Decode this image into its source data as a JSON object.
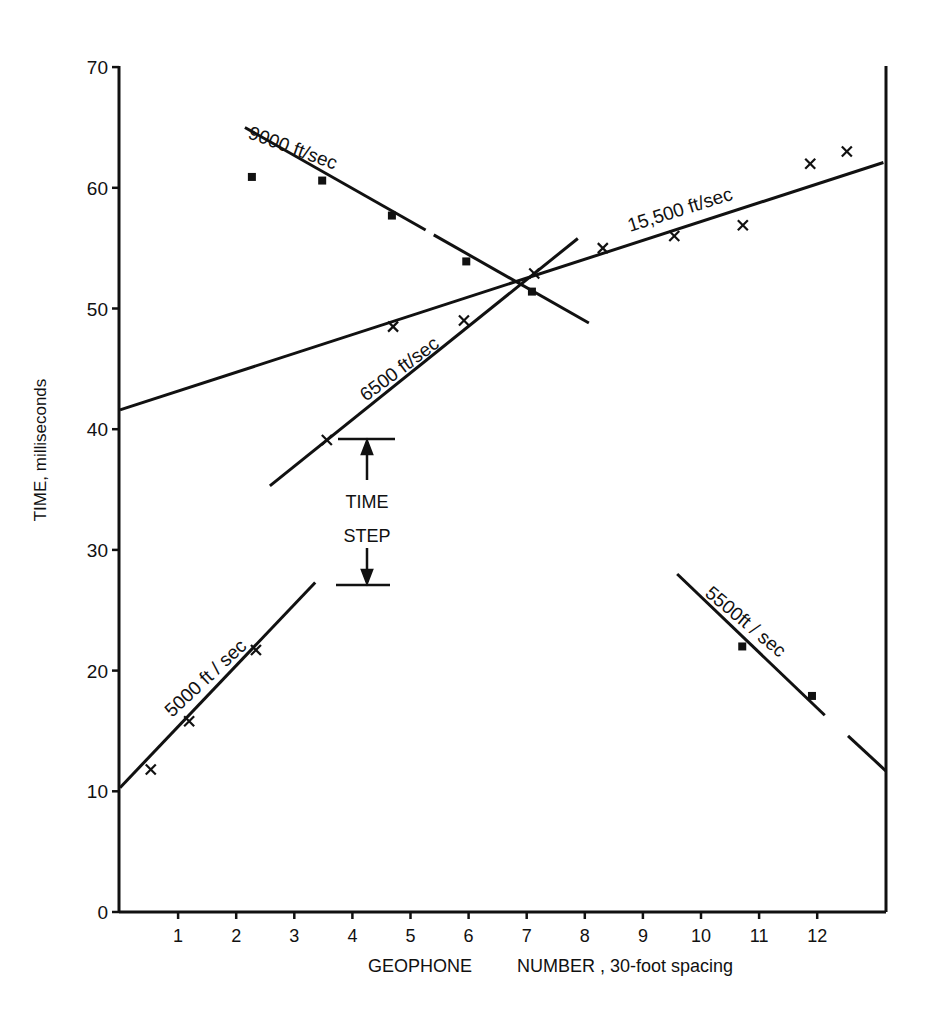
{
  "chart_data": {
    "type": "scatter",
    "title": "",
    "xlabel": "GEOPHONE      NUMBER , 30-foot spacing",
    "ylabel": "TIME, milliseconds",
    "xlim": [
      0,
      13.2
    ],
    "ylim": [
      0,
      70
    ],
    "grid": false,
    "x_ticks": [
      1,
      2,
      3,
      4,
      5,
      6,
      7,
      8,
      9,
      10,
      11,
      12
    ],
    "y_ticks": [
      0,
      10,
      20,
      30,
      40,
      50,
      60,
      70
    ],
    "series": [
      {
        "name": "x-marks (arrivals)",
        "marker": "x",
        "points": [
          [
            0.53,
            11.8
          ],
          [
            1.19,
            15.8
          ],
          [
            2.34,
            21.7
          ],
          [
            3.56,
            39.1
          ],
          [
            5.92,
            49.0
          ],
          [
            7.13,
            52.9
          ],
          [
            4.7,
            48.5
          ],
          [
            8.31,
            55.0
          ],
          [
            9.54,
            56.0
          ],
          [
            10.72,
            56.9
          ],
          [
            11.88,
            62.0
          ],
          [
            12.51,
            63.0
          ]
        ]
      },
      {
        "name": "square-marks (reverse arrivals)",
        "marker": "square",
        "points": [
          [
            2.27,
            60.9
          ],
          [
            3.48,
            60.6
          ],
          [
            4.68,
            57.7
          ],
          [
            5.96,
            53.9
          ],
          [
            7.09,
            51.4
          ],
          [
            10.71,
            22.0
          ],
          [
            11.91,
            17.9
          ]
        ]
      }
    ],
    "lines": [
      {
        "label": "15,500 ft/sec",
        "segments": [
          [
            [
              0,
              41.6
            ],
            [
              13.14,
              62.1
            ]
          ]
        ]
      },
      {
        "label": "9000 ft/sec",
        "segments": [
          [
            [
              2.15,
              65.0
            ],
            [
              5.26,
              56.5
            ]
          ],
          [
            [
              5.4,
              56.1
            ],
            [
              8.07,
              48.8
            ]
          ]
        ]
      },
      {
        "label": "6500 ft/sec",
        "segments": [
          [
            [
              2.58,
              35.3
            ],
            [
              7.88,
              55.8
            ]
          ]
        ]
      },
      {
        "label": "5000 ft / sec",
        "segments": [
          [
            [
              0,
              10.3
            ],
            [
              3.36,
              27.3
            ]
          ]
        ]
      },
      {
        "label": "5500ft / sec",
        "segments": [
          [
            [
              9.59,
              28.0
            ],
            [
              12.13,
              16.3
            ]
          ],
          [
            [
              12.53,
              14.6
            ],
            [
              13.18,
              11.7
            ]
          ]
        ]
      }
    ],
    "annotations": [
      {
        "text": "TIME",
        "x": 4.3,
        "y": 34.5
      },
      {
        "text": "STEP",
        "x": 4.3,
        "y": 31.5
      },
      {
        "type": "time-step-bracket",
        "x": 4.3,
        "y_top": 39.1,
        "y_bottom": 27.2
      }
    ]
  },
  "labels": {
    "line_15500": "15,500 ft/sec",
    "line_9000": "9000 ft/sec",
    "line_6500": "6500 ft/sec",
    "line_5000": "5000 ft / sec",
    "line_5500": "5500ft / sec",
    "time": "TIME",
    "step": "STEP",
    "ylabel": "TIME,  milliseconds",
    "xlabel_a": "GEOPHONE",
    "xlabel_b": "NUMBER ,  30-foot  spacing"
  }
}
